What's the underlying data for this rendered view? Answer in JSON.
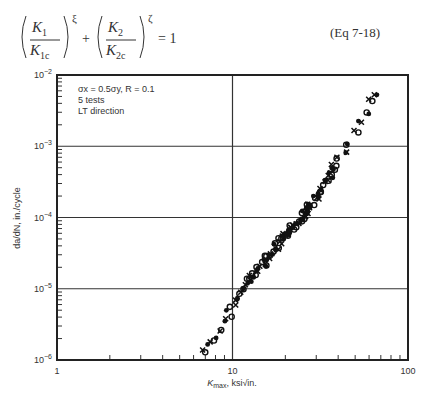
{
  "equation": {
    "latex": "(K_1/K_{1c})^{\\xi} + (K_2/K_{2c})^{\\zeta} = 1",
    "t1_num": "K",
    "t1_num_sub": "1",
    "t1_den": "K",
    "t1_den_sub": "1c",
    "t1_exp": "ξ",
    "t2_num": "K",
    "t2_num_sub": "2",
    "t2_den": "K",
    "t2_den_sub": "2c",
    "t2_exp": "ζ",
    "plus": "+",
    "equals": "= 1",
    "label": "(Eq 7-18)"
  },
  "chart_data": {
    "type": "scatter",
    "title": "",
    "xlabel": "K_max, ksi√in.",
    "ylabel": "da/dN, in./cycle",
    "xscale": "log",
    "yscale": "log",
    "xlim": [
      1,
      100
    ],
    "ylim": [
      1e-06,
      0.01
    ],
    "x_ticks": [
      "1",
      "10",
      "100"
    ],
    "y_ticks": [
      "10^-6",
      "10^-5",
      "10^-4",
      "10^-3",
      "10^-2"
    ],
    "grid": true,
    "annotations": [
      "σx = 0.5σy, R = 0.1",
      "5 tests",
      "LT direction"
    ],
    "series": [
      {
        "name": "5 tests, LT direction",
        "marker": "mixed (x, o, *)",
        "points": [
          [
            7.0,
            1.3e-06
          ],
          [
            7.5,
            1.8e-06
          ],
          [
            8.0,
            2e-06
          ],
          [
            8.5,
            2.4e-06
          ],
          [
            9.0,
            3.5e-06
          ],
          [
            9.5,
            4.5e-06
          ],
          [
            10,
            5.5e-06
          ],
          [
            10.5,
            7e-06
          ],
          [
            11,
            8e-06
          ],
          [
            11.5,
            9.5e-06
          ],
          [
            12,
            1.1e-05
          ],
          [
            12.5,
            1.3e-05
          ],
          [
            13,
            1.5e-05
          ],
          [
            14,
            1.9e-05
          ],
          [
            15,
            2.3e-05
          ],
          [
            16,
            2.8e-05
          ],
          [
            17,
            3.3e-05
          ],
          [
            18,
            3.9e-05
          ],
          [
            19,
            4.6e-05
          ],
          [
            20,
            5.3e-05
          ],
          [
            21,
            6.1e-05
          ],
          [
            22,
            7e-05
          ],
          [
            23,
            8e-05
          ],
          [
            24,
            9.2e-05
          ],
          [
            25,
            0.000105
          ],
          [
            26,
            0.00012
          ],
          [
            27,
            0.000135
          ],
          [
            28,
            0.00015
          ],
          [
            30,
            0.000185
          ],
          [
            32,
            0.00023
          ],
          [
            34,
            0.0003
          ],
          [
            36,
            0.0004
          ],
          [
            38,
            0.00052
          ],
          [
            40,
            0.00065
          ],
          [
            43,
            0.00085
          ],
          [
            46,
            0.0011
          ],
          [
            50,
            0.0016
          ],
          [
            54,
            0.0022
          ],
          [
            58,
            0.003
          ],
          [
            62,
            0.0042
          ],
          [
            65,
            0.0058
          ]
        ]
      }
    ]
  }
}
